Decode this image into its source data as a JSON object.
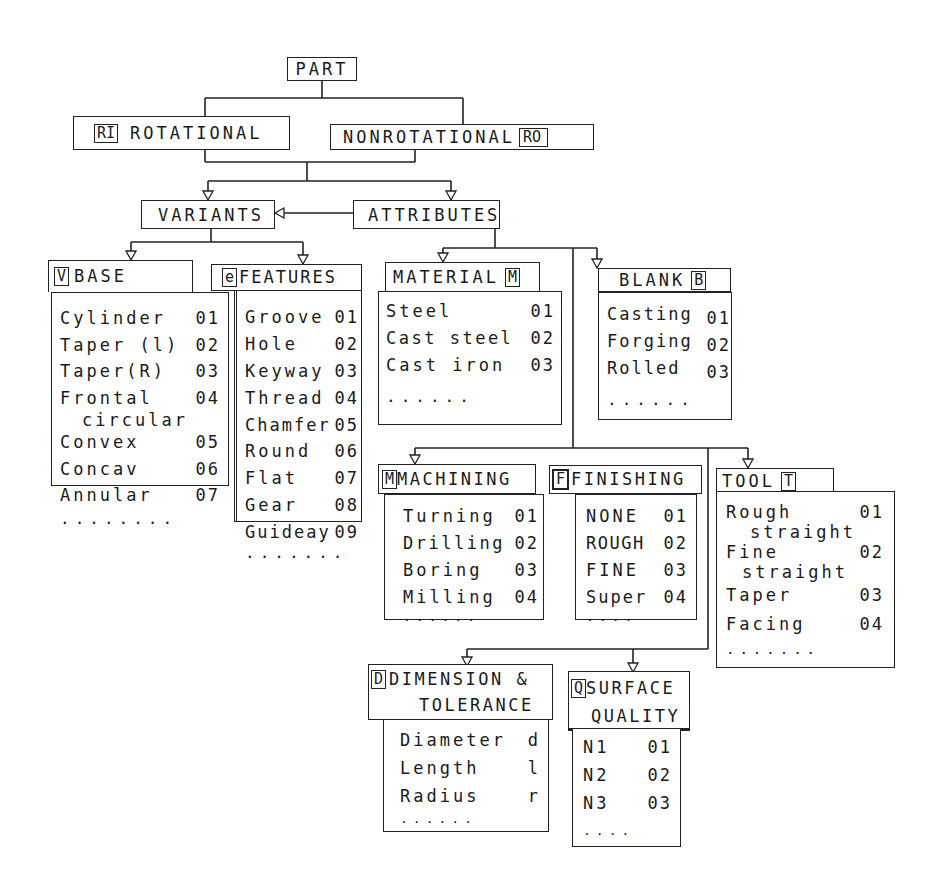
{
  "root": {
    "label": "PART"
  },
  "level1": {
    "rotational": {
      "code": "RI",
      "label": "ROTATIONAL"
    },
    "nonrotational": {
      "code": "RO",
      "label": "NONROTATIONAL"
    }
  },
  "level2": {
    "variants": {
      "label": "VARIANTS"
    },
    "attributes": {
      "label": "ATTRIBUTES"
    }
  },
  "base": {
    "code": "V",
    "label": "BASE",
    "items": [
      {
        "name": "Cylinder",
        "code": "01"
      },
      {
        "name": "Taper (l)",
        "code": "02"
      },
      {
        "name": "Taper(R)",
        "code": "03"
      },
      {
        "name": "Frontal",
        "code": "04",
        "sub": "circular"
      },
      {
        "name": "Convex",
        "code": "05"
      },
      {
        "name": "Concav",
        "code": "06"
      },
      {
        "name": "Annular",
        "code": "07"
      }
    ],
    "more": "........"
  },
  "features": {
    "code": "e",
    "label": "FEATURES",
    "items": [
      {
        "name": "Groove",
        "code": "01"
      },
      {
        "name": "Hole",
        "code": "02"
      },
      {
        "name": "Keyway",
        "code": "03"
      },
      {
        "name": "Thread",
        "code": "04"
      },
      {
        "name": "Chamfer",
        "code": "05"
      },
      {
        "name": "Round",
        "code": "06"
      },
      {
        "name": "Flat",
        "code": "07"
      },
      {
        "name": "Gear",
        "code": "08"
      },
      {
        "name": "Guideay",
        "code": "09"
      }
    ],
    "more": "......."
  },
  "material": {
    "code": "M",
    "label": "MATERIAL",
    "items": [
      {
        "name": "Steel",
        "code": "01"
      },
      {
        "name": "Cast steel",
        "code": "02"
      },
      {
        "name": "Cast iron",
        "code": "03"
      }
    ],
    "more": "......"
  },
  "blank": {
    "code": "B",
    "label": "BLANK",
    "items": [
      {
        "name": "Casting",
        "code": "01"
      },
      {
        "name": "Forging",
        "code": "02"
      },
      {
        "name": "Rolled",
        "code": "03"
      }
    ],
    "more": "......"
  },
  "machining": {
    "code": "M",
    "label": "MACHINING",
    "items": [
      {
        "name": "Turning",
        "code": "01"
      },
      {
        "name": "Drilling",
        "code": "02"
      },
      {
        "name": "Boring",
        "code": "03"
      },
      {
        "name": "Milling",
        "code": "04"
      }
    ],
    "more": "......"
  },
  "finishing": {
    "code": "F",
    "label": "FINISHING",
    "items": [
      {
        "name": "NONE",
        "code": "01"
      },
      {
        "name": "ROUGH",
        "code": "02"
      },
      {
        "name": "FINE",
        "code": "03"
      },
      {
        "name": "Super",
        "code": "04"
      }
    ],
    "more": "...."
  },
  "tool": {
    "code": "T",
    "label": "TOOL",
    "items": [
      {
        "name": "Rough",
        "code": "01",
        "sub": "straight"
      },
      {
        "name": "Fine",
        "code": "02",
        "sub": "straight"
      },
      {
        "name": "Taper",
        "code": "03"
      },
      {
        "name": "Facing",
        "code": "04"
      }
    ],
    "more": "......."
  },
  "dimension": {
    "code": "D",
    "label_line1": "DIMENSION &",
    "label_line2": "TOLERANCE",
    "items": [
      {
        "name": "Diameter",
        "code": "d"
      },
      {
        "name": "Length",
        "code": "l"
      },
      {
        "name": "Radius",
        "code": "r"
      }
    ],
    "more": "......"
  },
  "surface": {
    "code": "Q",
    "label_line1": "SURFACE",
    "label_line2": "QUALITY",
    "items": [
      {
        "name": "N1",
        "code": "01"
      },
      {
        "name": "N2",
        "code": "02"
      },
      {
        "name": "N3",
        "code": "03"
      }
    ],
    "more": "...."
  }
}
